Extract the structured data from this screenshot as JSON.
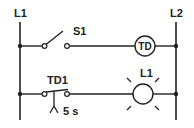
{
  "diagram": {
    "type": "ladder-logic",
    "rails": {
      "left": "L1",
      "right": "L2"
    },
    "rungs": [
      {
        "contact": "S1",
        "contact_type": "normally-open switch",
        "output": "TD",
        "output_type": "timer coil"
      },
      {
        "contact": "TD1",
        "contact_type": "timed contact",
        "delay": "5 s",
        "output": "L1",
        "output_type": "lamp"
      }
    ]
  },
  "colors": {
    "line": "#222222",
    "background": "#ffffff"
  }
}
